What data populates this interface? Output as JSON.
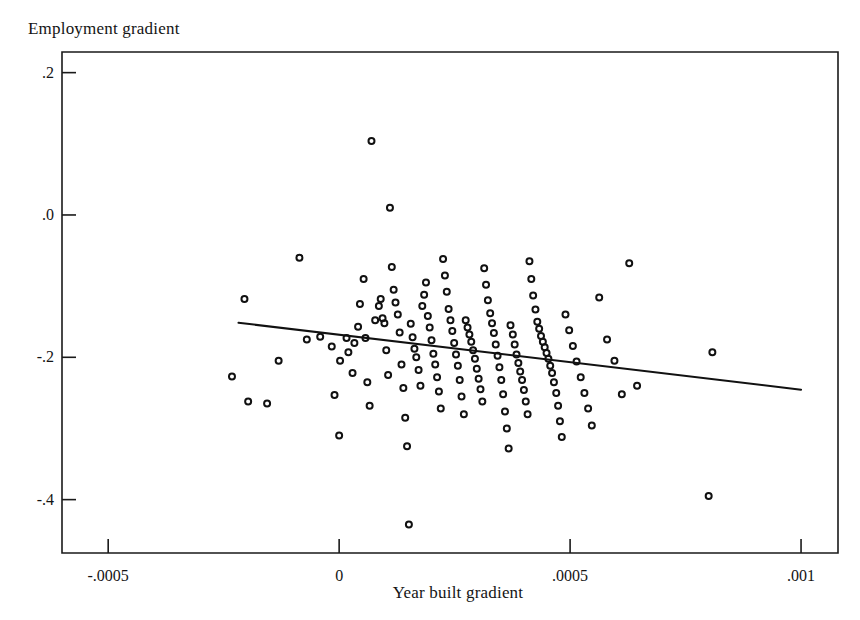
{
  "figure": {
    "title": "",
    "y_axis_title": "Employment gradient",
    "x_axis_title": "Year built gradient"
  },
  "chart_data": {
    "type": "scatter",
    "title": "",
    "xlabel": "Year built gradient",
    "ylabel": "Employment gradient",
    "xlim": [
      -0.0006,
      0.00108
    ],
    "ylim": [
      -0.475,
      0.229
    ],
    "grid": false,
    "legend": "none",
    "xticks": [
      -0.0005,
      0,
      0.0005,
      0.001
    ],
    "xtick_labels": [
      "-.0005",
      "0",
      ".0005",
      ".001"
    ],
    "yticks": [
      0.2,
      0.0,
      -0.2,
      -0.4
    ],
    "ytick_labels": [
      ".2",
      ".0",
      "-.2",
      "-.4"
    ],
    "marker": "open-circle",
    "marker_color": "#111111",
    "marker_size_px": 6,
    "fit_line": {
      "name": "linear fit",
      "color": "#111111",
      "width_px": 2,
      "x_start": -0.000218,
      "y_start": -0.1515,
      "x_end": 0.001,
      "y_end": -0.2455,
      "slope": -77.2,
      "intercept": -0.1683
    },
    "x": [
      -0.000205,
      -0.000232,
      -0.000197,
      -0.000156,
      -0.000131,
      -8.6e-05,
      -7e-05,
      -4.1e-05,
      -1.6e-05,
      -1e-05,
      0.0,
      2e-06,
      1.6e-05,
      2e-05,
      2.9e-05,
      3.3e-05,
      4.1e-05,
      4.5e-05,
      5.3e-05,
      5.7e-05,
      6.1e-05,
      6.6e-05,
      7e-05,
      7.8e-05,
      8.6e-05,
      9e-05,
      9.4e-05,
      9.8e-05,
      0.000102,
      0.000106,
      0.00011,
      0.000114,
      0.000118,
      0.000122,
      0.000127,
      0.000131,
      0.000135,
      0.000139,
      0.000143,
      0.000147,
      0.000151,
      0.000155,
      0.000159,
      0.000163,
      0.000167,
      0.000172,
      0.000176,
      0.00018,
      0.000184,
      0.000188,
      0.000192,
      0.000196,
      0.0002,
      0.000204,
      0.000208,
      0.000212,
      0.000216,
      0.00022,
      0.000225,
      0.000229,
      0.000233,
      0.000237,
      0.000241,
      0.000245,
      0.000249,
      0.000253,
      0.000257,
      0.000261,
      0.000265,
      0.00027,
      0.000274,
      0.000278,
      0.000282,
      0.000286,
      0.00029,
      0.000294,
      0.000298,
      0.000302,
      0.000306,
      0.00031,
      0.000314,
      0.000318,
      0.000322,
      0.000327,
      0.000331,
      0.000335,
      0.000339,
      0.000343,
      0.000347,
      0.000351,
      0.000355,
      0.000359,
      0.000363,
      0.000367,
      0.000371,
      0.000376,
      0.00038,
      0.000384,
      0.000388,
      0.000392,
      0.000396,
      0.0004,
      0.000404,
      0.000408,
      0.000412,
      0.000416,
      0.00042,
      0.000425,
      0.000429,
      0.000433,
      0.000437,
      0.000441,
      0.000445,
      0.000449,
      0.000453,
      0.000457,
      0.000461,
      0.000465,
      0.00047,
      0.000474,
      0.000478,
      0.000482,
      0.00049,
      0.000498,
      0.000506,
      0.000514,
      0.000523,
      0.000531,
      0.000539,
      0.000547,
      0.000563,
      0.00058,
      0.000596,
      0.000612,
      0.000628,
      0.000645,
      0.0008,
      0.000808
    ],
    "y": [
      -0.118,
      -0.227,
      -0.262,
      -0.265,
      -0.205,
      -0.06,
      -0.175,
      -0.171,
      -0.185,
      -0.253,
      -0.31,
      -0.205,
      -0.173,
      -0.193,
      -0.222,
      -0.18,
      -0.157,
      -0.125,
      -0.09,
      -0.173,
      -0.235,
      -0.268,
      0.104,
      -0.148,
      -0.128,
      -0.118,
      -0.145,
      -0.152,
      -0.19,
      -0.225,
      0.01,
      -0.073,
      -0.105,
      -0.123,
      -0.14,
      -0.165,
      -0.21,
      -0.243,
      -0.285,
      -0.325,
      -0.435,
      -0.153,
      -0.172,
      -0.188,
      -0.2,
      -0.218,
      -0.24,
      -0.128,
      -0.112,
      -0.095,
      -0.142,
      -0.158,
      -0.176,
      -0.195,
      -0.21,
      -0.228,
      -0.248,
      -0.272,
      -0.062,
      -0.085,
      -0.108,
      -0.132,
      -0.148,
      -0.163,
      -0.18,
      -0.196,
      -0.212,
      -0.232,
      -0.255,
      -0.28,
      -0.148,
      -0.158,
      -0.168,
      -0.178,
      -0.19,
      -0.202,
      -0.216,
      -0.23,
      -0.245,
      -0.262,
      -0.075,
      -0.098,
      -0.12,
      -0.138,
      -0.152,
      -0.166,
      -0.182,
      -0.198,
      -0.214,
      -0.232,
      -0.252,
      -0.276,
      -0.3,
      -0.328,
      -0.155,
      -0.168,
      -0.182,
      -0.196,
      -0.208,
      -0.22,
      -0.232,
      -0.246,
      -0.262,
      -0.28,
      -0.065,
      -0.09,
      -0.113,
      -0.133,
      -0.15,
      -0.16,
      -0.17,
      -0.178,
      -0.186,
      -0.194,
      -0.202,
      -0.212,
      -0.222,
      -0.235,
      -0.25,
      -0.268,
      -0.29,
      -0.312,
      -0.14,
      -0.162,
      -0.184,
      -0.206,
      -0.228,
      -0.25,
      -0.272,
      -0.296,
      -0.116,
      -0.175,
      -0.205,
      -0.252,
      -0.068,
      -0.24,
      -0.395,
      -0.193,
      -0.386,
      -0.15
    ]
  }
}
